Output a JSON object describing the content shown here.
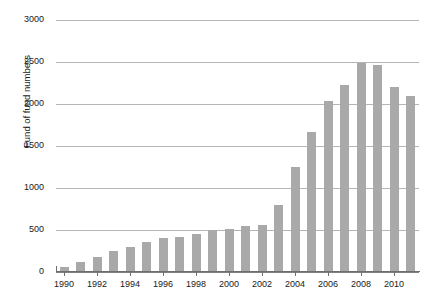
{
  "chart_data": {
    "type": "bar",
    "title": "",
    "subtitle": "",
    "xlabel": "",
    "ylabel": "Fund of fund numbers",
    "categories": [
      "1990",
      "1991",
      "1992",
      "1993",
      "1994",
      "1995",
      "1996",
      "1997",
      "1998",
      "1999",
      "2000",
      "2001",
      "2002",
      "2003",
      "2004",
      "2005",
      "2006",
      "2007",
      "2008",
      "2009",
      "2010",
      "2011"
    ],
    "values": [
      60,
      120,
      180,
      250,
      300,
      360,
      400,
      420,
      450,
      500,
      510,
      550,
      560,
      800,
      1250,
      1670,
      2030,
      2230,
      2490,
      2470,
      2200,
      2100
    ],
    "x_tick_labels": [
      "1990",
      "1992",
      "1994",
      "1996",
      "1998",
      "2000",
      "2002",
      "2004",
      "2006",
      "2008",
      "2010"
    ],
    "y_tick_labels": [
      "0",
      "500",
      "1000",
      "1500",
      "2000",
      "2500",
      "3000"
    ],
    "y_tick_values": [
      0,
      500,
      1000,
      1500,
      2000,
      2500,
      3000
    ],
    "ylim": [
      0,
      3000
    ],
    "grid": true,
    "legend": false,
    "legend_position": "none",
    "bar_color": "#a9a9a9",
    "gridline_color": "#b5b5b5",
    "axis_color": "#6e6e6e",
    "text_color": "#1a1a1a",
    "background_color": "#ffffff"
  }
}
